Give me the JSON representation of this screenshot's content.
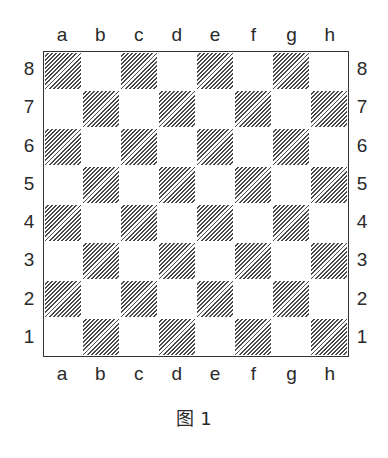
{
  "board": {
    "files": [
      "a",
      "b",
      "c",
      "d",
      "e",
      "f",
      "g",
      "h"
    ],
    "ranks": [
      "8",
      "7",
      "6",
      "5",
      "4",
      "3",
      "2",
      "1"
    ],
    "dark_square_style": "diagonal-hatch",
    "bottom_left_square": "dark"
  },
  "caption": "图 1"
}
